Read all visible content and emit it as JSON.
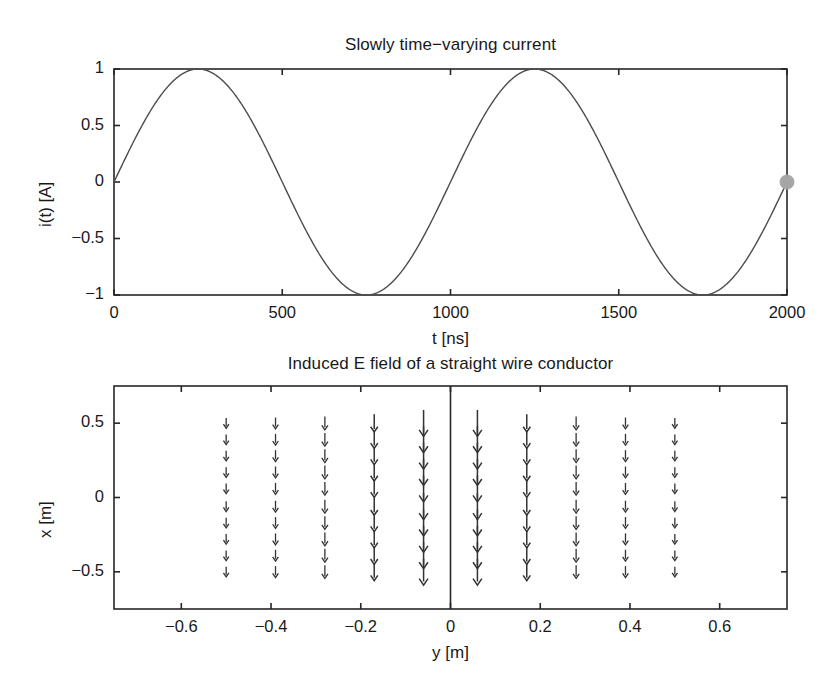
{
  "figure": {
    "background": "#ffffff",
    "line_color": "#4d4d4d",
    "axis_color": "#262626",
    "marker_color": "#a6a6a6",
    "arrow_color": "#333333"
  },
  "chart_data": [
    {
      "type": "line",
      "name": "current-waveform",
      "title": "Slowly time−varying current",
      "xlabel": "t [ns]",
      "ylabel": "i(t) [A]",
      "xlim": [
        0,
        2000
      ],
      "ylim": [
        -1,
        1
      ],
      "xticks": [
        0,
        500,
        1000,
        1500,
        2000
      ],
      "xticklabels": [
        "0",
        "500",
        "1000",
        "1500",
        "2000"
      ],
      "yticks": [
        -1,
        -0.5,
        0,
        0.5,
        1
      ],
      "yticklabels": [
        "−1",
        "−0.5",
        "0",
        "0.5",
        "1"
      ],
      "grid": false,
      "legend": "none",
      "equation": "i(t) = sin(2*pi*t/1000), t in ns",
      "period_ns": 1000,
      "amplitude_A": 1,
      "samples_x": [
        0,
        125,
        250,
        375,
        500,
        625,
        750,
        875,
        1000,
        1125,
        1250,
        1375,
        1500,
        1625,
        1750,
        1875,
        2000
      ],
      "samples_y": [
        0,
        0.707,
        1,
        0.707,
        0,
        -0.707,
        -1,
        -0.707,
        0,
        0.707,
        1,
        0.707,
        0,
        -0.707,
        -1,
        -0.707,
        0
      ],
      "marker": {
        "label": "current-time-marker",
        "x": 2000,
        "y": 0,
        "color": "#a6a6a6",
        "radius": 7
      }
    },
    {
      "type": "quiver",
      "name": "induced-e-field",
      "title": "Induced E field of a straight wire conductor",
      "xlabel": "y [m]",
      "ylabel": "x [m]",
      "xlim": [
        -0.75,
        0.75
      ],
      "ylim": [
        -0.75,
        0.75
      ],
      "xticks": [
        -0.6,
        -0.4,
        -0.2,
        0,
        0.2,
        0.4,
        0.6
      ],
      "xticklabels": [
        "−0.6",
        "−0.4",
        "−0.2",
        "0",
        "0.2",
        "0.4",
        "0.6"
      ],
      "yticks": [
        -0.5,
        0,
        0.5
      ],
      "yticklabels": [
        "−0.5",
        "0",
        "0.5"
      ],
      "grid": false,
      "legend": "none",
      "conductor_line_y": 0,
      "arrow_direction": "down",
      "column_y_values": [
        -0.5,
        -0.39,
        -0.28,
        -0.17,
        -0.06,
        0.06,
        0.17,
        0.28,
        0.39,
        0.5
      ],
      "column_magnitudes": [
        0.22,
        0.28,
        0.37,
        0.58,
        1.0,
        1.0,
        0.58,
        0.37,
        0.28,
        0.22
      ],
      "row_x_values": [
        0.5,
        0.39,
        0.28,
        0.17,
        0.06,
        -0.06,
        -0.17,
        -0.28,
        -0.39,
        -0.5
      ],
      "rows": 10,
      "columns": 10
    }
  ]
}
